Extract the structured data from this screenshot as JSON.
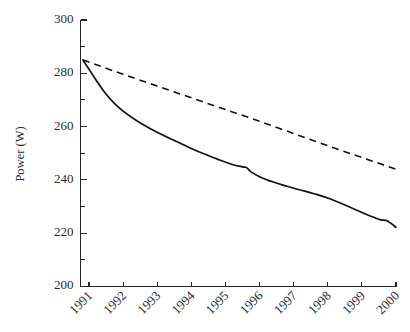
{
  "chart_data": {
    "type": "line",
    "title": "",
    "subtitle": "",
    "xlabel": "",
    "ylabel": "Power (W)",
    "xlim": [
      1990.75,
      2000.0
    ],
    "ylim": [
      200,
      300
    ],
    "grid": false,
    "legend": "none",
    "y_ticks_major": [
      200,
      220,
      240,
      260,
      280,
      300
    ],
    "y_ticks_minor": [
      210,
      230,
      250,
      270,
      290
    ],
    "y_tick_labels": [
      "200",
      "220",
      "240",
      "260",
      "280",
      "300"
    ],
    "x_ticks": [
      1991,
      1992,
      1993,
      1994,
      1995,
      1996,
      1997,
      1998,
      1999,
      2000
    ],
    "x_tick_labels": [
      "1991",
      "1992",
      "1993",
      "1994",
      "1995",
      "1996",
      "1997",
      "1998",
      "1999",
      "2000"
    ],
    "x_tick_label_rotation_deg": -45,
    "series": [
      {
        "name": "solid-curve",
        "style": "solid",
        "color": "#111111",
        "x": [
          1990.82,
          1991.0,
          1991.2,
          1991.45,
          1991.75,
          1992.0,
          1992.4,
          1992.8,
          1993.2,
          1993.6,
          1994.0,
          1994.4,
          1994.8,
          1995.2,
          1995.5,
          1995.62,
          1995.75,
          1996.0,
          1996.4,
          1996.8,
          1997.2,
          1997.6,
          1998.0,
          1998.5,
          1999.0,
          1999.3,
          1999.55,
          1999.75,
          2000.0
        ],
        "y": [
          285.0,
          281.5,
          277.6,
          273.0,
          268.6,
          265.8,
          262.2,
          259.2,
          256.6,
          254.2,
          251.8,
          249.6,
          247.6,
          245.8,
          244.9,
          244.6,
          243.0,
          241.2,
          239.2,
          237.6,
          236.2,
          234.8,
          233.2,
          230.6,
          227.8,
          226.2,
          225.0,
          224.6,
          222.2
        ]
      },
      {
        "name": "dashed-line",
        "style": "dashed",
        "color": "#111111",
        "x": [
          1990.82,
          1992.0,
          1993.0,
          1994.0,
          1995.0,
          1996.0,
          1997.0,
          1998.0,
          1999.0,
          2000.0
        ],
        "y": [
          285.0,
          279.6,
          275.2,
          270.8,
          266.4,
          262.0,
          257.4,
          252.8,
          248.4,
          244.0
        ]
      }
    ],
    "annotations": []
  },
  "figure": {
    "background_color": "#ffffff",
    "axis_color": "#262626",
    "text_color": "#2b2b2b"
  }
}
